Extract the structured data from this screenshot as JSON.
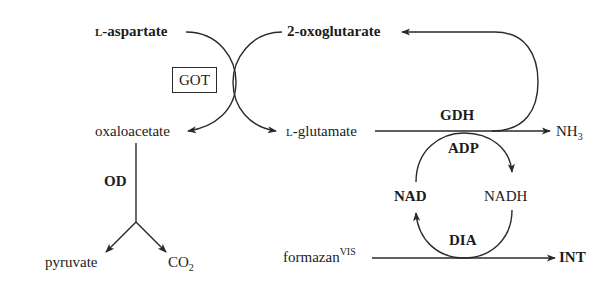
{
  "diagram": {
    "nodes": {
      "aspartate": {
        "prefix": "L",
        "name": "-aspartate"
      },
      "oxoglutarate": {
        "name": "2-oxoglutarate"
      },
      "oxaloacetate": {
        "name": "oxaloacetate"
      },
      "glutamate": {
        "prefix": "L",
        "name": "-glutamate"
      },
      "nh3": {
        "main": "NH",
        "sub": "3"
      },
      "pyruvate": {
        "name": "pyruvate"
      },
      "co2": {
        "main": "CO",
        "sub": "2"
      },
      "nad": {
        "name": "NAD"
      },
      "nadh": {
        "name": "NADH"
      },
      "adp": {
        "name": "ADP"
      },
      "formazan": {
        "main": "formazan",
        "sup": "VIS"
      },
      "int": {
        "name": "INT"
      }
    },
    "enzymes": {
      "got": "GOT",
      "gdh": "GDH",
      "od": "OD",
      "dia": "DIA"
    },
    "colors": {
      "line": "#2a2a2a",
      "text": "#1c1c1c",
      "background": "#ffffff"
    }
  }
}
